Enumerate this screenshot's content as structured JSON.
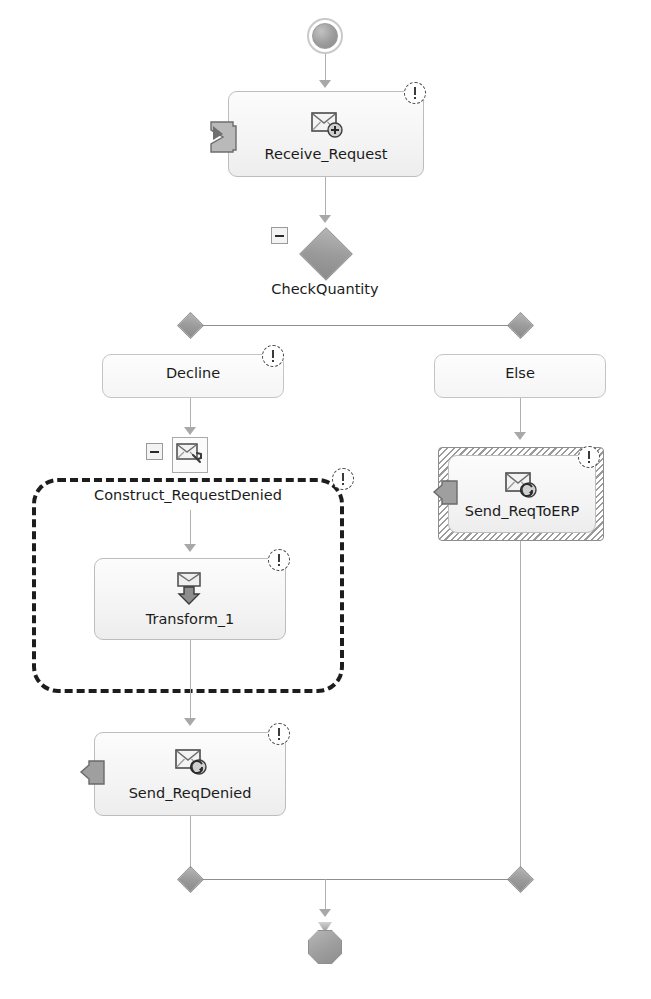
{
  "diagram": {
    "type": "orchestration-flow",
    "start": {
      "name": "start-shape"
    },
    "end": {
      "name": "end-shape"
    },
    "shapes": [
      {
        "id": "receive-request",
        "label": "Receive_Request",
        "kind": "receive",
        "icon": "receive-message-icon",
        "port": "receive-port-icon",
        "warning": true
      },
      {
        "id": "check-quantity",
        "label": "CheckQuantity",
        "kind": "decide",
        "icon": "decide-diamond-icon",
        "collapsed": true
      },
      {
        "id": "decline-branch",
        "label": "Decline",
        "kind": "branch-rule",
        "warning": true
      },
      {
        "id": "else-branch",
        "label": "Else",
        "kind": "branch-else",
        "warning": false
      },
      {
        "id": "construct-request-denied",
        "label": "Construct_RequestDenied",
        "kind": "construct-message",
        "icon": "construct-message-icon",
        "collapsed": true,
        "warning": true,
        "selected": "dashed"
      },
      {
        "id": "transform-1",
        "label": "Transform_1",
        "kind": "transform",
        "icon": "transform-icon",
        "warning": true
      },
      {
        "id": "send-req-denied",
        "label": "Send_ReqDenied",
        "kind": "send",
        "icon": "send-message-icon",
        "port": "send-port-icon",
        "warning": true
      },
      {
        "id": "send-req-to-erp",
        "label": "Send_ReqToERP",
        "kind": "send",
        "icon": "send-message-icon",
        "port": "send-port-icon",
        "warning": true,
        "selected": "hatched"
      }
    ],
    "colors": {
      "canvas_background": "#ffffff",
      "shape_border": "#bdbdbd",
      "shape_fill": "#f5f5f5",
      "connector": "#b0b0b0",
      "diamond_fill": "#9b9b9b",
      "text": "#1b1b1b",
      "selection_dashed": "#1d1d1d",
      "selection_hatch": "#9a9a9a",
      "warning_badge": "#3a3a3a"
    }
  }
}
